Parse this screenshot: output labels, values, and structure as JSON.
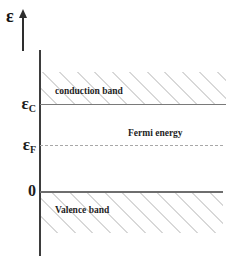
{
  "chart_data": {
    "type": "diagram",
    "title": "",
    "ylabel": "ε",
    "xlabel": "",
    "grid": false,
    "legend": null,
    "axis": {
      "symbol": "ε",
      "direction": "up",
      "arrow": true
    },
    "ticks": [
      {
        "id": "epsilon_c",
        "symbol": "ε",
        "subscript": "C",
        "y_px": 104
      },
      {
        "id": "epsilon_f",
        "symbol": "ε",
        "subscript": "F",
        "y_px": 145
      },
      {
        "id": "zero",
        "symbol": "0",
        "subscript": "",
        "y_px": 192
      }
    ],
    "levels": [
      {
        "id": "conduction_band_edge",
        "label": "conduction band",
        "style": "solid",
        "color": "#7a7a7a",
        "value_symbol": "εC"
      },
      {
        "id": "fermi_level",
        "label": "Fermi energy",
        "style": "dashed",
        "color": "#a8a8a8",
        "value_symbol": "εF"
      },
      {
        "id": "valence_band_edge",
        "label": "Valence band",
        "style": "solid",
        "color": "#6e6e6e",
        "value_symbol": "0"
      }
    ],
    "regions": [
      {
        "id": "conduction_band",
        "label": "conduction band",
        "fill": "hatched",
        "position": "above conduction band edge"
      },
      {
        "id": "valence_band",
        "label": "Valence band",
        "fill": "hatched",
        "position": "below valence band edge"
      }
    ]
  },
  "axis": {
    "symbol": "ε"
  },
  "labels": {
    "epsilon_c": "ε",
    "epsilon_c_sub": "C",
    "epsilon_f": "ε",
    "epsilon_f_sub": "F",
    "zero": "0",
    "conduction_band": "conduction band",
    "fermi_energy": "Fermi energy",
    "valence_band": "Valence band"
  },
  "colors": {
    "background": "#ffffff",
    "axis": "#3d3d3d",
    "conduction_line": "#7a7a7a",
    "fermi_line": "#a8a8a8",
    "valence_line": "#6e6e6e",
    "hatch": "#d8d8d8",
    "text": "#1d1d1d"
  }
}
